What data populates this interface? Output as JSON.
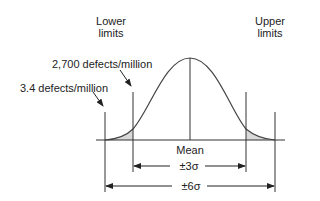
{
  "diagram": {
    "type": "six-sigma-normal-distribution",
    "labels": {
      "lower_limits_line1": "Lower",
      "lower_limits_line2": "limits",
      "upper_limits_line1": "Upper",
      "upper_limits_line2": "limits",
      "defects_3sigma": "2,700 defects/million",
      "defects_6sigma": "3.4 defects/million",
      "mean": "Mean",
      "three_sigma": "±3σ",
      "six_sigma": "±6σ"
    },
    "colors": {
      "line": "#333333",
      "tail_fill": "#d9d9d9"
    }
  }
}
